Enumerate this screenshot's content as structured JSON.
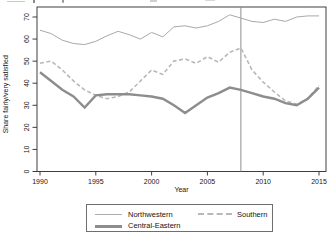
{
  "chart_data": {
    "type": "line",
    "title": "",
    "xlabel": "Year",
    "ylabel": "Share fairly/very satisfied",
    "x": [
      1990,
      1991,
      1992,
      1993,
      1994,
      1995,
      1996,
      1997,
      1998,
      1999,
      2000,
      2001,
      2002,
      2003,
      2004,
      2005,
      2006,
      2007,
      2008,
      2009,
      2010,
      2011,
      2012,
      2013,
      2014,
      2015
    ],
    "xticks": [
      1990,
      1995,
      2000,
      2005,
      2010,
      2015
    ],
    "yticks": [
      0,
      10,
      20,
      30,
      40,
      50,
      60,
      70
    ],
    "ylim": [
      0,
      74
    ],
    "xlim": [
      1989.7,
      2015.6
    ],
    "grid": false,
    "legend_position": "bottom",
    "vline": {
      "x": 2008,
      "color": "#8f8f8f",
      "width": 1
    },
    "series": [
      {
        "name": "Northwestern",
        "color": "#a9a9a9",
        "width": 1,
        "dash": "",
        "values": [
          64,
          62.5,
          59.5,
          58,
          57.5,
          59,
          61.5,
          63.5,
          62,
          60,
          63,
          61,
          65.5,
          66,
          65,
          66,
          68,
          71,
          69.5,
          68,
          67.5,
          69,
          68,
          70,
          70.5,
          70.5
        ]
      },
      {
        "name": "Southern",
        "color": "#b8b8b8",
        "width": 1.6,
        "dash": "4,2.5",
        "values": [
          49,
          50,
          46,
          41,
          37,
          34.5,
          33,
          34,
          36,
          41,
          46,
          44,
          50,
          51,
          49,
          52,
          49.5,
          54,
          56,
          46,
          40.5,
          36,
          32,
          30.5,
          33,
          39
        ]
      },
      {
        "name": "Central-Eastern",
        "color": "#8d8d8d",
        "width": 2.4,
        "dash": "",
        "values": [
          45,
          41,
          37,
          34,
          29,
          34.5,
          35,
          35,
          35,
          34.5,
          34,
          33,
          30,
          26.5,
          30,
          33.5,
          35.5,
          38,
          37,
          35.5,
          34,
          33,
          31,
          30,
          33,
          38
        ]
      }
    ],
    "axis": {
      "frame_color": "#2b2b2b",
      "tick_color": "#2b2b2b",
      "text_color": "#161616"
    }
  },
  "legend": {
    "row1_left": "Northwestern",
    "row1_right": "Southern",
    "row2_left": "Central-Eastern"
  }
}
